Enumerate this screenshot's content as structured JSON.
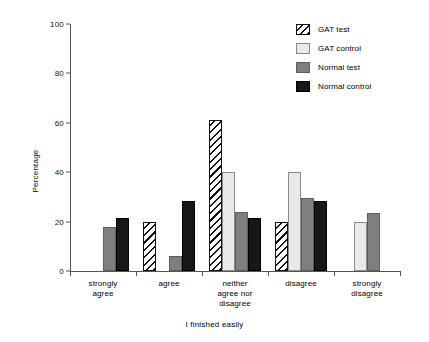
{
  "chart_data": {
    "type": "bar",
    "title": "",
    "xlabel": "I finished easily",
    "ylabel": "Percentage",
    "ylim": [
      0,
      100
    ],
    "yticks": [
      0,
      20,
      40,
      60,
      80,
      100
    ],
    "grid": false,
    "legend_position": "top-right",
    "categories": [
      "strongly\nagree",
      "agree",
      "neither\nagree nor\ndisagree",
      "disagree",
      "strongly\ndisagree"
    ],
    "category_lines": [
      [
        "strongly",
        "agree"
      ],
      [
        "agree"
      ],
      [
        "neither",
        "agree nor",
        "disagree"
      ],
      [
        "disagree"
      ],
      [
        "strongly",
        "disagree"
      ]
    ],
    "series": [
      {
        "name": "GAT test",
        "pattern": "diagonal-hatch",
        "color": "#ffffff",
        "hatch_color": "#111111",
        "values": [
          null,
          20,
          61,
          20,
          null
        ]
      },
      {
        "name": "GAT control",
        "pattern": "solid",
        "color": "#e9e9e9",
        "values": [
          null,
          null,
          40,
          40,
          20
        ]
      },
      {
        "name": "Normal test",
        "pattern": "solid",
        "color": "#7f7f7f",
        "values": [
          18,
          6,
          24,
          29.5,
          23.5
        ]
      },
      {
        "name": "Normal control",
        "pattern": "solid",
        "color": "#171717",
        "values": [
          21.5,
          28.5,
          21.5,
          28.5,
          null
        ]
      }
    ]
  },
  "legend": {
    "items": [
      {
        "label": "GAT test"
      },
      {
        "label": "GAT control"
      },
      {
        "label": "Normal test"
      },
      {
        "label": "Normal control"
      }
    ]
  }
}
